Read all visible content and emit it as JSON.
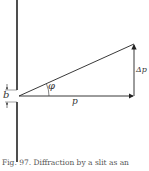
{
  "figure": {
    "labels": {
      "b": "b",
      "phi": "φ",
      "p": "p",
      "delta_p": "Δp"
    },
    "caption": "Fig. 97. Diffraction by a slit as an"
  },
  "colors": {
    "ink": "#222222",
    "background": "#ffffff"
  }
}
